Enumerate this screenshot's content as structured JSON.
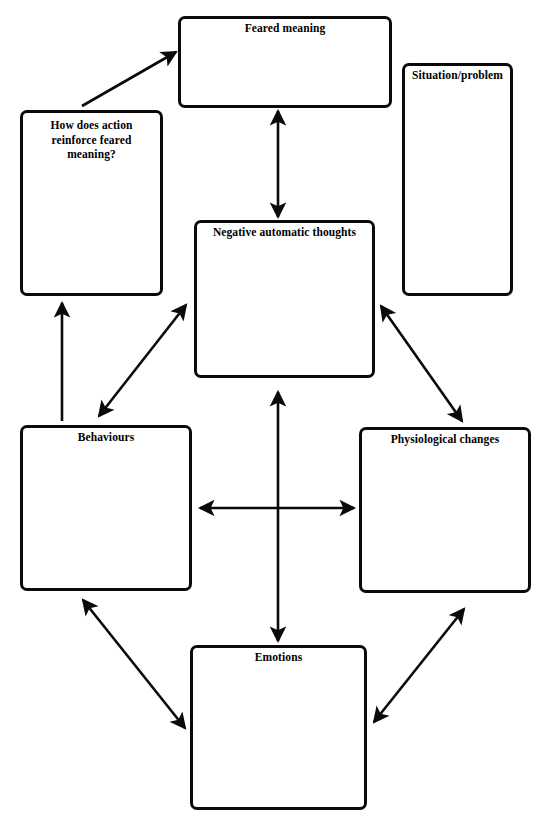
{
  "diagram": {
    "type": "flow-diagram",
    "canvas": {
      "width": 547,
      "height": 830
    },
    "style": {
      "background_color": "#ffffff",
      "line_color": "#0a0a0a",
      "text_color": "#000000",
      "box_border_width": 3.5,
      "arrow_stroke_width": 2.6
    },
    "nodes": [
      {
        "id": "feared-meaning",
        "label": "Feared meaning",
        "x": 178,
        "y": 16,
        "width": 214,
        "height": 92,
        "label_lines": [
          "Feared meaning"
        ]
      },
      {
        "id": "situation-problem",
        "label": "Situation/problem",
        "x": 402,
        "y": 63,
        "width": 111,
        "height": 233,
        "label_lines": [
          "Situation/problem"
        ]
      },
      {
        "id": "how-does-action",
        "label": "How does action reinforce feared meaning?",
        "x": 20,
        "y": 110,
        "width": 143,
        "height": 186,
        "label_lines": [
          "How does action",
          "reinforce feared",
          "meaning?"
        ]
      },
      {
        "id": "negative-automatic-thoughts",
        "label": "Negative automatic thoughts",
        "x": 194,
        "y": 220,
        "width": 181,
        "height": 158,
        "label_lines": [
          "Negative automatic thoughts"
        ]
      },
      {
        "id": "behaviours",
        "label": "Behaviours",
        "x": 20,
        "y": 425,
        "width": 172,
        "height": 166,
        "label_lines": [
          "Behaviours"
        ]
      },
      {
        "id": "physiological-changes",
        "label": "Physiological changes",
        "x": 359,
        "y": 427,
        "width": 172,
        "height": 166,
        "label_lines": [
          "Physiological changes"
        ]
      },
      {
        "id": "emotions",
        "label": "Emotions",
        "x": 190,
        "y": 645,
        "width": 177,
        "height": 165,
        "label_lines": [
          "Emotions"
        ]
      }
    ],
    "connectors": [
      {
        "id": "action-to-feared-meaning",
        "from": "how-does-action",
        "to": "feared-meaning",
        "heads": "single",
        "x1": 82,
        "y1": 106,
        "x2": 176,
        "y2": 52
      },
      {
        "id": "feared-meaning-to-nat",
        "from": "feared-meaning",
        "to": "negative-automatic-thoughts",
        "heads": "double",
        "x1": 278,
        "y1": 111,
        "x2": 278,
        "y2": 217
      },
      {
        "id": "behaviours-to-action",
        "from": "behaviours",
        "to": "how-does-action",
        "heads": "single",
        "x1": 62,
        "y1": 421,
        "x2": 62,
        "y2": 303
      },
      {
        "id": "behaviours-to-nat",
        "from": "behaviours",
        "to": "negative-automatic-thoughts",
        "heads": "double",
        "x1": 99,
        "y1": 416,
        "x2": 186,
        "y2": 305
      },
      {
        "id": "nat-to-physiological",
        "from": "negative-automatic-thoughts",
        "to": "physiological-changes",
        "heads": "double",
        "x1": 381,
        "y1": 306,
        "x2": 462,
        "y2": 421
      },
      {
        "id": "nat-to-emotions",
        "from": "negative-automatic-thoughts",
        "to": "emotions",
        "heads": "double",
        "x1": 278,
        "y1": 392,
        "x2": 278,
        "y2": 641
      },
      {
        "id": "behaviours-to-physiological",
        "from": "behaviours",
        "to": "physiological-changes",
        "heads": "double",
        "x1": 200,
        "y1": 508,
        "x2": 354,
        "y2": 508
      },
      {
        "id": "behaviours-to-emotions",
        "from": "behaviours",
        "to": "emotions",
        "heads": "double",
        "x1": 83,
        "y1": 600,
        "x2": 185,
        "y2": 728
      },
      {
        "id": "emotions-to-physiological",
        "from": "emotions",
        "to": "physiological-changes",
        "heads": "double",
        "x1": 374,
        "y1": 722,
        "x2": 464,
        "y2": 609
      }
    ]
  }
}
